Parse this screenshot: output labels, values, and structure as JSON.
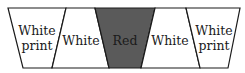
{
  "diagram": {
    "segments": [
      {
        "id": "left-white-print",
        "label_lines": [
          "White",
          "print"
        ],
        "fill": "#ffffff"
      },
      {
        "id": "left-white",
        "label_lines": [
          "White"
        ],
        "fill": "#ffffff"
      },
      {
        "id": "center-red",
        "label_lines": [
          "Red"
        ],
        "fill": "#5a5a5a"
      },
      {
        "id": "right-white",
        "label_lines": [
          "White"
        ],
        "fill": "#ffffff"
      },
      {
        "id": "right-white-print",
        "label_lines": [
          "White",
          "print"
        ],
        "fill": "#ffffff"
      }
    ],
    "stroke_color": "#1a1a1a"
  }
}
